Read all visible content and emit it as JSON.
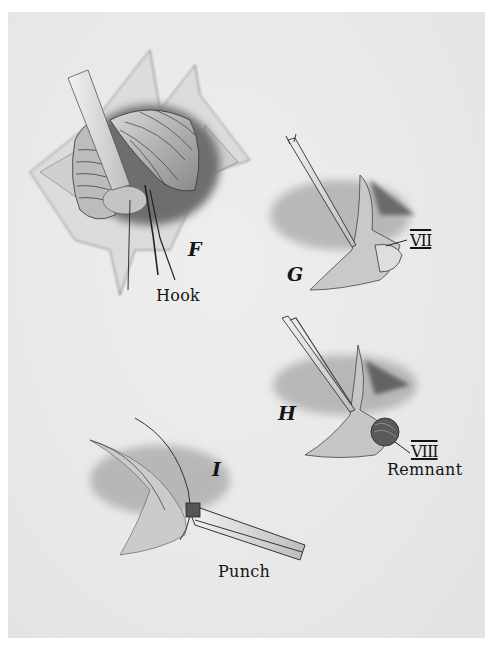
{
  "figure": {
    "panels": [
      {
        "id": "F",
        "letter": "F",
        "callout": "Hook"
      },
      {
        "id": "G",
        "letter": "G",
        "callout": "VII"
      },
      {
        "id": "H",
        "letter": "H",
        "callout": "VIII",
        "callout2": "Remnant"
      },
      {
        "id": "I",
        "letter": "I",
        "callout": "Punch"
      }
    ]
  },
  "colors": {
    "paper": "#e9e9e9",
    "border": "#ffffff",
    "ink": "#141414"
  }
}
